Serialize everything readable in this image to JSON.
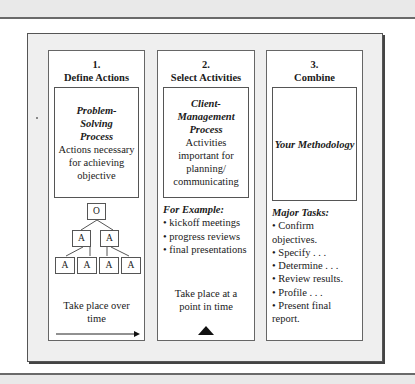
{
  "diagram": {
    "columns": [
      {
        "number": "1.",
        "heading": "Define Actions",
        "box_title": "Problem-Solving Process",
        "box_title_lines": [
          "Problem-",
          "Solving",
          "Process"
        ],
        "box_text_lines": [
          "Actions necessary",
          "for achieving",
          "objective"
        ],
        "tree": {
          "root": "O",
          "level2": [
            "A",
            "A"
          ],
          "level3": [
            "A",
            "A",
            "A",
            "A"
          ]
        },
        "footer_lines": [
          "Take place over",
          "time"
        ],
        "footer_icon": "arrow-right-icon"
      },
      {
        "number": "2.",
        "heading": "Select Activities",
        "box_title": "Client-Management Process",
        "box_title_lines": [
          "Client-",
          "Management",
          "Process"
        ],
        "box_text_lines": [
          "Activities",
          "important for",
          "planning/",
          "communicating"
        ],
        "list_heading": "For Example:",
        "list_items": [
          "kickoff meetings",
          "progress reviews",
          "final presentations"
        ],
        "footer_lines": [
          "Take place at a",
          "point in time"
        ],
        "footer_icon": "triangle-up-icon"
      },
      {
        "number": "3.",
        "heading": "Combine",
        "box_title": "Your Methodology",
        "list_heading": "Major Tasks:",
        "list_items": [
          "Confirm objectives.",
          "Specify . . .",
          "Determine . . .",
          "Review results.",
          "Profile . . .",
          "Present final report."
        ]
      }
    ]
  }
}
